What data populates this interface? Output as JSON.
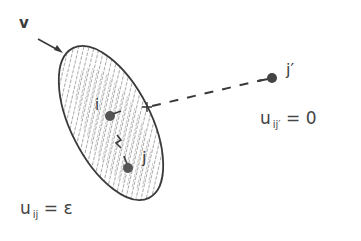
{
  "diagram": {
    "labels": {
      "external_input": "v",
      "node_i": "i",
      "node_j": "j",
      "node_j_prime": "j′"
    },
    "equations": {
      "far_node": {
        "var": "u",
        "sub": "ij′",
        "op": "=",
        "value": "0"
      },
      "near_node": {
        "var": "u",
        "sub": "ij",
        "op": "=",
        "value": "ε"
      }
    },
    "elements": {
      "neighborhood": "hatched-ellipse",
      "connection_far": "dashed-line",
      "input_arrow": "arrow"
    },
    "colors": {
      "ink": "#3a3a3a",
      "node_fill": "#555555",
      "hatch": "#777777",
      "background": "#ffffff"
    }
  }
}
